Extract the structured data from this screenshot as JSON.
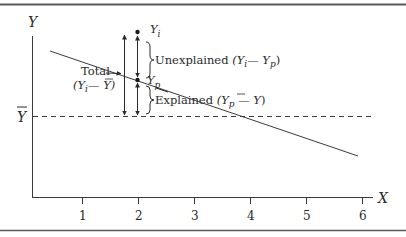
{
  "diagram": {
    "type": "regression-deviation-decomposition",
    "axes": {
      "y_label": "Y",
      "x_label": "X",
      "ybar_label": "Y",
      "x_ticks": [
        "1",
        "2",
        "3",
        "4",
        "5",
        "6"
      ]
    },
    "points": {
      "observed": {
        "label": "Y",
        "subscript": "i"
      },
      "predicted": {
        "label": "Y",
        "subscript": "p"
      }
    },
    "annotations": {
      "total": {
        "title": "Total",
        "expr_open": "(Y",
        "expr_sub": "i",
        "expr_close": "— Y)"
      },
      "unexplained": {
        "title": "Unexplained",
        "expr_open": "(Y",
        "expr_sub1": "i",
        "expr_mid": "— Y",
        "expr_sub2": "p",
        "expr_close": ")"
      },
      "explained": {
        "title": "Explained",
        "expr_open": "(Y",
        "expr_sub": "p",
        "expr_mid": " — Y",
        "expr_close": ")"
      }
    },
    "colors": {
      "line": "#3a3a3a",
      "rule": "#5a5a5a",
      "text": "#2a2a2a"
    }
  }
}
